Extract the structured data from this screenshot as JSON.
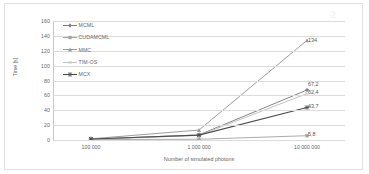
{
  "chart_data": {
    "type": "line",
    "title": "",
    "xlabel": "Number of simulated photons",
    "ylabel": "Time [s]",
    "categories": [
      "100 000",
      "1 000 000",
      "10 000 000"
    ],
    "x_tick_labels": [
      "100 000",
      "1 000 000",
      "10 000 000"
    ],
    "y_tick_labels": [
      "0",
      "20",
      "40",
      "60",
      "80",
      "100",
      "120",
      "140",
      "160"
    ],
    "ylim": [
      0,
      160
    ],
    "y_major_step": 20,
    "grid": "horizontal",
    "legend_position": "inside-top-left",
    "series": [
      {
        "name": "MCML",
        "color": "#7f7f7f",
        "marker": "diamond",
        "values": [
          1.1,
          6.8,
          67.2
        ],
        "end_label": "67,2"
      },
      {
        "name": "CUDAMCML",
        "color": "#a6a6a6",
        "marker": "square",
        "values": [
          0.6,
          1.0,
          5.8
        ],
        "end_label": "5,8"
      },
      {
        "name": "MMC",
        "color": "#999999",
        "marker": "triangle",
        "values": [
          1.6,
          13.4,
          134
        ],
        "end_label": "134"
      },
      {
        "name": "TIM-OS",
        "color": "#bfbfbf",
        "marker": "x",
        "values": [
          0.9,
          6.2,
          62.4
        ],
        "end_label": "62,4"
      },
      {
        "name": "MCX",
        "color": "#4d4d4d",
        "marker": "asterisk",
        "values": [
          1.3,
          6.5,
          43.7
        ],
        "end_label": "43,7"
      }
    ],
    "data_labels": [
      "134",
      "67,2",
      "62,4",
      "43,7",
      "5,8"
    ]
  },
  "legend": {
    "items": [
      {
        "label": "MCML"
      },
      {
        "label": "CUDAMCML"
      },
      {
        "label": "MMC"
      },
      {
        "label": "TIM-OS"
      },
      {
        "label": "MCX"
      }
    ]
  },
  "axes": {
    "y_label": "Time [s]",
    "x_label": "Number of simulated photons",
    "y_ticks": [
      "160",
      "140",
      "120",
      "100",
      "80",
      "60",
      "40",
      "20",
      "0"
    ],
    "x_ticks": [
      "100 000",
      "1 000 000",
      "10 000 000"
    ]
  },
  "labels": {
    "l134": "134",
    "l672": "67,2",
    "l624": "62,4",
    "l437": "43,7",
    "l58": "5,8"
  },
  "artifact": {
    "glyph": "2"
  }
}
